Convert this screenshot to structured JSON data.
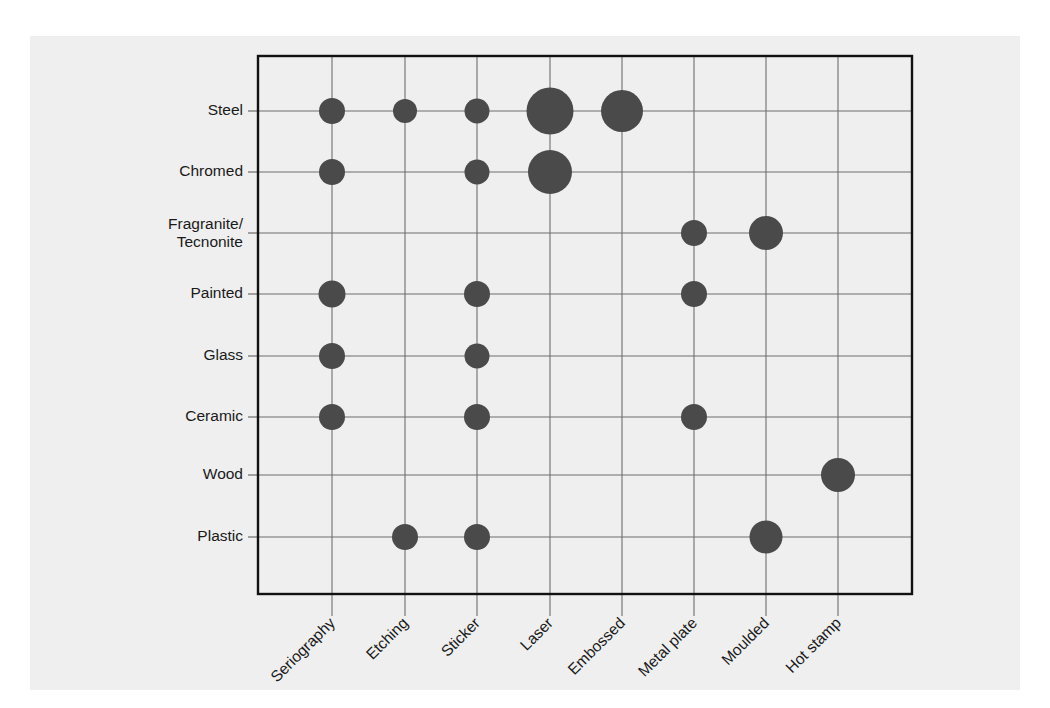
{
  "chart_data": {
    "type": "scatter",
    "title": "",
    "subtitle": "",
    "xlabel": "",
    "ylabel": "",
    "legend": [],
    "grid": true,
    "legend_position": "none",
    "bubble_color": "#4a4a4a",
    "background_color": "#efefef",
    "frame_color": "#111111",
    "grid_color": "#6e6e6e",
    "categories_x": [
      "Seriography",
      "Etching",
      "Sticker",
      "Laser",
      "Embossed",
      "Metal plate",
      "Moulded",
      "Hot stamp"
    ],
    "categories_y": [
      "Steel",
      "Chromed",
      "Fragranite/\nTecnonite",
      "Painted",
      "Glass",
      "Ceramic",
      "Wood",
      "Plastic"
    ],
    "points": [
      {
        "y": "Steel",
        "x": "Seriography",
        "size": 26
      },
      {
        "y": "Steel",
        "x": "Etching",
        "size": 24
      },
      {
        "y": "Steel",
        "x": "Sticker",
        "size": 25
      },
      {
        "y": "Steel",
        "x": "Laser",
        "size": 47
      },
      {
        "y": "Steel",
        "x": "Embossed",
        "size": 42
      },
      {
        "y": "Chromed",
        "x": "Seriography",
        "size": 26
      },
      {
        "y": "Chromed",
        "x": "Sticker",
        "size": 25
      },
      {
        "y": "Chromed",
        "x": "Laser",
        "size": 44
      },
      {
        "y": "Fragranite/\nTecnonite",
        "x": "Metal plate",
        "size": 26
      },
      {
        "y": "Fragranite/\nTecnonite",
        "x": "Moulded",
        "size": 34
      },
      {
        "y": "Painted",
        "x": "Seriography",
        "size": 27
      },
      {
        "y": "Painted",
        "x": "Sticker",
        "size": 26
      },
      {
        "y": "Painted",
        "x": "Metal plate",
        "size": 26
      },
      {
        "y": "Glass",
        "x": "Seriography",
        "size": 26
      },
      {
        "y": "Glass",
        "x": "Sticker",
        "size": 25
      },
      {
        "y": "Ceramic",
        "x": "Seriography",
        "size": 26
      },
      {
        "y": "Ceramic",
        "x": "Sticker",
        "size": 26
      },
      {
        "y": "Ceramic",
        "x": "Metal plate",
        "size": 26
      },
      {
        "y": "Wood",
        "x": "Hot stamp",
        "size": 34
      },
      {
        "y": "Plastic",
        "x": "Etching",
        "size": 26
      },
      {
        "y": "Plastic",
        "x": "Sticker",
        "size": 26
      },
      {
        "y": "Plastic",
        "x": "Moulded",
        "size": 33
      }
    ],
    "axis_geometry": {
      "plot_left": 258,
      "plot_right": 912,
      "plot_top": 56,
      "plot_bottom": 594,
      "x_positions": [
        332,
        405,
        477,
        550,
        622,
        694,
        766,
        838
      ],
      "y_positions": [
        111,
        172,
        233,
        294,
        356,
        417,
        475,
        537
      ],
      "y_label_x": 243,
      "y_tick_start": 248,
      "x_label_rotation": -45
    }
  }
}
